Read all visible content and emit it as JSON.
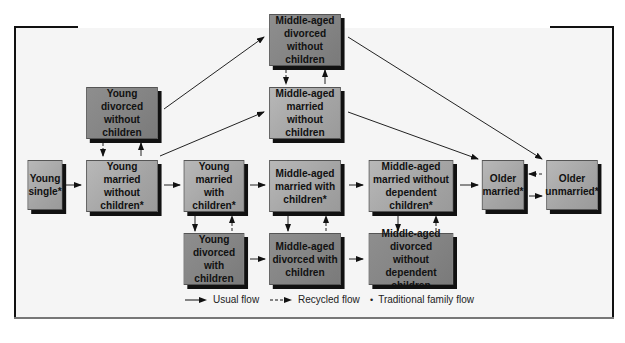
{
  "diagram": {
    "nodes": {
      "young_single": "Young single*",
      "young_divorced_without_children": "Young divorced without children",
      "young_married_without_children": "Young married without children*",
      "young_married_with_children": "Young married with children*",
      "young_divorced_with_children": "Young divorced with children",
      "middle_aged_divorced_without_children": "Middle-aged divorced without children",
      "middle_aged_married_without_children": "Middle-aged married without children",
      "middle_aged_married_with_children": "Middle-aged married with children*",
      "middle_aged_divorced_with_children": "Middle-aged divorced with children",
      "middle_aged_married_without_dependent_children": "Middle-aged married without dependent children*",
      "middle_aged_divorced_without_dependent_children": "Middle-aged divorced without dependent children",
      "older_married": "Older married*",
      "older_unmarried": "Older unmarried*"
    },
    "colors": {
      "married_box": "#a8a8a8",
      "divorced_box": "#858585",
      "shadow": "#111111",
      "line": "#222222"
    }
  },
  "legend": {
    "usual_flow": "Usual flow",
    "recycled_flow": "Recycled flow",
    "traditional_marker": "•",
    "traditional_flow": "Traditional family flow"
  }
}
